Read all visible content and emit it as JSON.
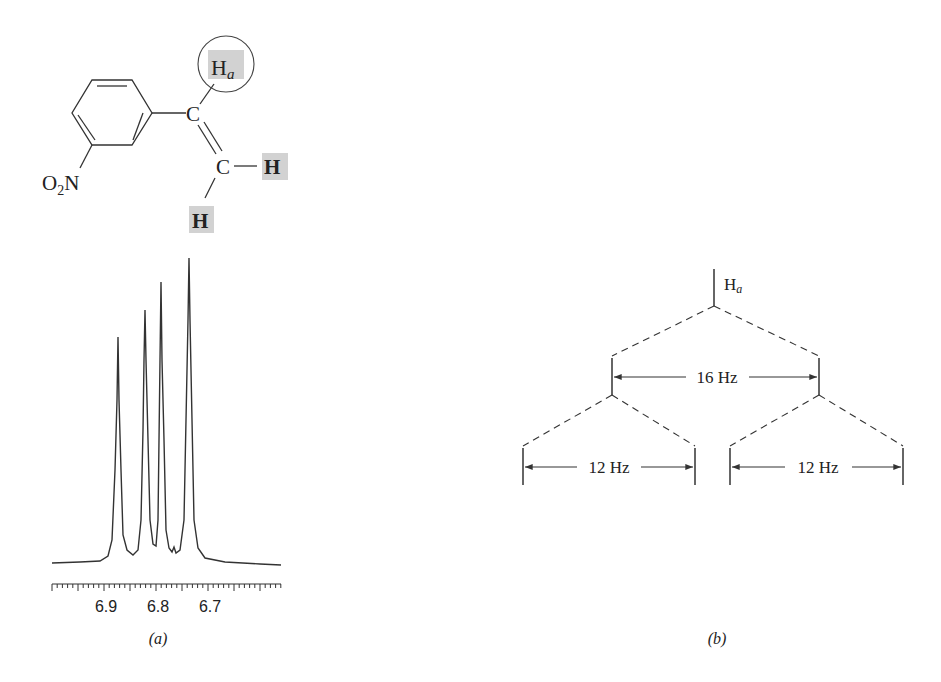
{
  "molecule": {
    "substituent": "O",
    "substituent_sub": "2",
    "substituent_atom": "N",
    "carbon_1": "C",
    "carbon_2": "C",
    "ha_label": "H",
    "ha_sub": "a",
    "h_right": "H",
    "h_bottom": "H",
    "highlight_color": "#d2d2d2"
  },
  "panel_a": {
    "caption": "(a)",
    "tick_labels": [
      "6.9",
      "6.8",
      "6.7"
    ]
  },
  "panel_b": {
    "caption": "(b)",
    "root_label": "H",
    "root_sub": "a",
    "split1_label": "16 Hz",
    "split2_left_label": "12 Hz",
    "split2_right_label": "12 Hz"
  },
  "chart_data": {
    "type": "line",
    "xlabel": "ppm",
    "ylabel": "",
    "x_ticks": [
      6.9,
      6.8,
      6.7
    ],
    "x_direction": "decreasing",
    "peaks": [
      {
        "ppm": 6.88,
        "relative_height": 0.75
      },
      {
        "ppm": 6.83,
        "relative_height": 0.84
      },
      {
        "ppm": 6.8,
        "relative_height": 0.93
      },
      {
        "ppm": 6.74,
        "relative_height": 1.0
      }
    ],
    "splitting_tree": {
      "root": "Ha",
      "level1": {
        "J_Hz": 16,
        "lines": 2
      },
      "level2": {
        "J_Hz": 12,
        "lines": 4
      }
    },
    "grid": false
  }
}
